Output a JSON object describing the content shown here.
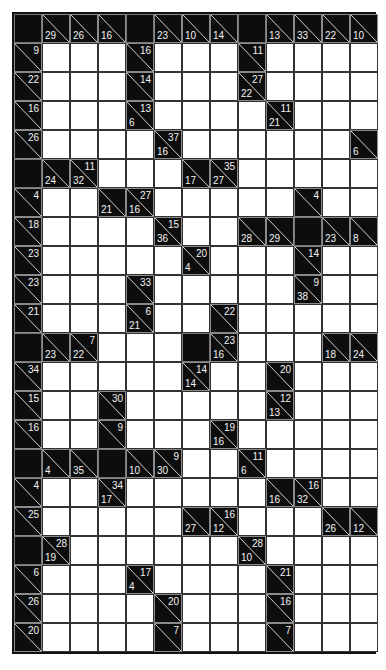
{
  "puzzle": {
    "type": "kakuro",
    "cols": 13,
    "rows": 22,
    "legend": {
      "B": "blank black cell",
      "W": "white entry cell",
      "C": "clue cell (a = across sum, d = down sum)"
    },
    "grid": [
      [
        {
          "t": "B"
        },
        {
          "t": "C",
          "d": "29"
        },
        {
          "t": "C",
          "d": "26"
        },
        {
          "t": "C",
          "d": "16"
        },
        {
          "t": "B"
        },
        {
          "t": "C",
          "d": "23"
        },
        {
          "t": "C",
          "d": "10"
        },
        {
          "t": "C",
          "d": "14"
        },
        {
          "t": "B"
        },
        {
          "t": "C",
          "d": "13"
        },
        {
          "t": "C",
          "d": "33"
        },
        {
          "t": "C",
          "d": "22"
        },
        {
          "t": "C",
          "d": "10"
        }
      ],
      [
        {
          "t": "C",
          "a": "9"
        },
        {
          "t": "W"
        },
        {
          "t": "W"
        },
        {
          "t": "W"
        },
        {
          "t": "C",
          "a": "16"
        },
        {
          "t": "W"
        },
        {
          "t": "W"
        },
        {
          "t": "W"
        },
        {
          "t": "C",
          "a": "11"
        },
        {
          "t": "W"
        },
        {
          "t": "W"
        },
        {
          "t": "W"
        },
        {
          "t": "W"
        }
      ],
      [
        {
          "t": "C",
          "a": "22"
        },
        {
          "t": "W"
        },
        {
          "t": "W"
        },
        {
          "t": "W"
        },
        {
          "t": "C",
          "a": "14"
        },
        {
          "t": "W"
        },
        {
          "t": "W"
        },
        {
          "t": "W"
        },
        {
          "t": "C",
          "a": "27",
          "d": "22"
        },
        {
          "t": "W"
        },
        {
          "t": "W"
        },
        {
          "t": "W"
        },
        {
          "t": "W"
        }
      ],
      [
        {
          "t": "C",
          "a": "16"
        },
        {
          "t": "W"
        },
        {
          "t": "W"
        },
        {
          "t": "W"
        },
        {
          "t": "C",
          "a": "13",
          "d": "6"
        },
        {
          "t": "W"
        },
        {
          "t": "W"
        },
        {
          "t": "W"
        },
        {
          "t": "W"
        },
        {
          "t": "C",
          "a": "11",
          "d": "21"
        },
        {
          "t": "W"
        },
        {
          "t": "W"
        },
        {
          "t": "W"
        }
      ],
      [
        {
          "t": "C",
          "a": "26"
        },
        {
          "t": "W"
        },
        {
          "t": "W"
        },
        {
          "t": "W"
        },
        {
          "t": "W"
        },
        {
          "t": "C",
          "a": "37",
          "d": "16"
        },
        {
          "t": "W"
        },
        {
          "t": "W"
        },
        {
          "t": "W"
        },
        {
          "t": "W"
        },
        {
          "t": "W"
        },
        {
          "t": "W"
        },
        {
          "t": "C",
          "d": "6"
        }
      ],
      [
        {
          "t": "B"
        },
        {
          "t": "C",
          "d": "24"
        },
        {
          "t": "C",
          "a": "11",
          "d": "32"
        },
        {
          "t": "W"
        },
        {
          "t": "W"
        },
        {
          "t": "W"
        },
        {
          "t": "C",
          "d": "17"
        },
        {
          "t": "C",
          "a": "35",
          "d": "27"
        },
        {
          "t": "W"
        },
        {
          "t": "W"
        },
        {
          "t": "W"
        },
        {
          "t": "W"
        },
        {
          "t": "W"
        }
      ],
      [
        {
          "t": "C",
          "a": "4"
        },
        {
          "t": "W"
        },
        {
          "t": "W"
        },
        {
          "t": "C",
          "d": "21"
        },
        {
          "t": "C",
          "a": "27",
          "d": "16"
        },
        {
          "t": "W"
        },
        {
          "t": "W"
        },
        {
          "t": "W"
        },
        {
          "t": "W"
        },
        {
          "t": "W"
        },
        {
          "t": "C",
          "a": "4"
        },
        {
          "t": "W"
        },
        {
          "t": "W"
        }
      ],
      [
        {
          "t": "C",
          "a": "18"
        },
        {
          "t": "W"
        },
        {
          "t": "W"
        },
        {
          "t": "W"
        },
        {
          "t": "W"
        },
        {
          "t": "C",
          "a": "15",
          "d": "36"
        },
        {
          "t": "W"
        },
        {
          "t": "W"
        },
        {
          "t": "C",
          "d": "28"
        },
        {
          "t": "C",
          "d": "29"
        },
        {
          "t": "B"
        },
        {
          "t": "C",
          "d": "23"
        },
        {
          "t": "C",
          "d": "8"
        }
      ],
      [
        {
          "t": "C",
          "a": "23"
        },
        {
          "t": "W"
        },
        {
          "t": "W"
        },
        {
          "t": "W"
        },
        {
          "t": "W"
        },
        {
          "t": "W"
        },
        {
          "t": "C",
          "a": "20",
          "d": "4"
        },
        {
          "t": "W"
        },
        {
          "t": "W"
        },
        {
          "t": "W"
        },
        {
          "t": "C",
          "a": "14"
        },
        {
          "t": "W"
        },
        {
          "t": "W"
        }
      ],
      [
        {
          "t": "C",
          "a": "23"
        },
        {
          "t": "W"
        },
        {
          "t": "W"
        },
        {
          "t": "W"
        },
        {
          "t": "C",
          "a": "33"
        },
        {
          "t": "W"
        },
        {
          "t": "W"
        },
        {
          "t": "W"
        },
        {
          "t": "W"
        },
        {
          "t": "W"
        },
        {
          "t": "C",
          "a": "9",
          "d": "38"
        },
        {
          "t": "W"
        },
        {
          "t": "W"
        }
      ],
      [
        {
          "t": "C",
          "a": "21"
        },
        {
          "t": "W"
        },
        {
          "t": "W"
        },
        {
          "t": "W"
        },
        {
          "t": "C",
          "a": "6",
          "d": "21"
        },
        {
          "t": "W"
        },
        {
          "t": "W"
        },
        {
          "t": "C",
          "a": "22"
        },
        {
          "t": "W"
        },
        {
          "t": "W"
        },
        {
          "t": "W"
        },
        {
          "t": "W"
        },
        {
          "t": "W"
        }
      ],
      [
        {
          "t": "B"
        },
        {
          "t": "C",
          "d": "23"
        },
        {
          "t": "C",
          "a": "7",
          "d": "22"
        },
        {
          "t": "W"
        },
        {
          "t": "W"
        },
        {
          "t": "W"
        },
        {
          "t": "B"
        },
        {
          "t": "C",
          "a": "23",
          "d": "16"
        },
        {
          "t": "W"
        },
        {
          "t": "W"
        },
        {
          "t": "W"
        },
        {
          "t": "C",
          "d": "18"
        },
        {
          "t": "C",
          "d": "24"
        }
      ],
      [
        {
          "t": "C",
          "a": "34"
        },
        {
          "t": "W"
        },
        {
          "t": "W"
        },
        {
          "t": "W"
        },
        {
          "t": "W"
        },
        {
          "t": "W"
        },
        {
          "t": "C",
          "a": "14",
          "d": "14"
        },
        {
          "t": "W"
        },
        {
          "t": "W"
        },
        {
          "t": "C",
          "a": "20"
        },
        {
          "t": "W"
        },
        {
          "t": "W"
        },
        {
          "t": "W"
        }
      ],
      [
        {
          "t": "C",
          "a": "15"
        },
        {
          "t": "W"
        },
        {
          "t": "W"
        },
        {
          "t": "C",
          "a": "30"
        },
        {
          "t": "W"
        },
        {
          "t": "W"
        },
        {
          "t": "W"
        },
        {
          "t": "W"
        },
        {
          "t": "W"
        },
        {
          "t": "C",
          "a": "12",
          "d": "13"
        },
        {
          "t": "W"
        },
        {
          "t": "W"
        },
        {
          "t": "W"
        }
      ],
      [
        {
          "t": "C",
          "a": "16"
        },
        {
          "t": "W"
        },
        {
          "t": "W"
        },
        {
          "t": "C",
          "a": "9"
        },
        {
          "t": "W"
        },
        {
          "t": "W"
        },
        {
          "t": "W"
        },
        {
          "t": "C",
          "a": "19",
          "d": "16"
        },
        {
          "t": "W"
        },
        {
          "t": "W"
        },
        {
          "t": "W"
        },
        {
          "t": "W"
        },
        {
          "t": "W"
        }
      ],
      [
        {
          "t": "B"
        },
        {
          "t": "C",
          "d": "4"
        },
        {
          "t": "C",
          "d": "35"
        },
        {
          "t": "B"
        },
        {
          "t": "C",
          "d": "10"
        },
        {
          "t": "C",
          "a": "9",
          "d": "30"
        },
        {
          "t": "W"
        },
        {
          "t": "W"
        },
        {
          "t": "C",
          "a": "11",
          "d": "6"
        },
        {
          "t": "W"
        },
        {
          "t": "W"
        },
        {
          "t": "W"
        },
        {
          "t": "W"
        }
      ],
      [
        {
          "t": "C",
          "a": "4"
        },
        {
          "t": "W"
        },
        {
          "t": "W"
        },
        {
          "t": "C",
          "a": "34",
          "d": "17"
        },
        {
          "t": "W"
        },
        {
          "t": "W"
        },
        {
          "t": "W"
        },
        {
          "t": "W"
        },
        {
          "t": "W"
        },
        {
          "t": "C",
          "d": "16"
        },
        {
          "t": "C",
          "a": "16",
          "d": "32"
        },
        {
          "t": "W"
        },
        {
          "t": "W"
        }
      ],
      [
        {
          "t": "C",
          "a": "25"
        },
        {
          "t": "W"
        },
        {
          "t": "W"
        },
        {
          "t": "W"
        },
        {
          "t": "W"
        },
        {
          "t": "W"
        },
        {
          "t": "C",
          "d": "27"
        },
        {
          "t": "C",
          "a": "16",
          "d": "12"
        },
        {
          "t": "W"
        },
        {
          "t": "W"
        },
        {
          "t": "W"
        },
        {
          "t": "C",
          "d": "26"
        },
        {
          "t": "C",
          "d": "12"
        }
      ],
      [
        {
          "t": "B"
        },
        {
          "t": "C",
          "a": "28",
          "d": "19"
        },
        {
          "t": "W"
        },
        {
          "t": "W"
        },
        {
          "t": "W"
        },
        {
          "t": "W"
        },
        {
          "t": "W"
        },
        {
          "t": "W"
        },
        {
          "t": "C",
          "a": "28",
          "d": "10"
        },
        {
          "t": "W"
        },
        {
          "t": "W"
        },
        {
          "t": "W"
        },
        {
          "t": "W"
        }
      ],
      [
        {
          "t": "C",
          "a": "6"
        },
        {
          "t": "W"
        },
        {
          "t": "W"
        },
        {
          "t": "W"
        },
        {
          "t": "C",
          "a": "17",
          "d": "4"
        },
        {
          "t": "W"
        },
        {
          "t": "W"
        },
        {
          "t": "W"
        },
        {
          "t": "W"
        },
        {
          "t": "C",
          "a": "21"
        },
        {
          "t": "W"
        },
        {
          "t": "W"
        },
        {
          "t": "W"
        }
      ],
      [
        {
          "t": "C",
          "a": "26"
        },
        {
          "t": "W"
        },
        {
          "t": "W"
        },
        {
          "t": "W"
        },
        {
          "t": "W"
        },
        {
          "t": "C",
          "a": "20"
        },
        {
          "t": "W"
        },
        {
          "t": "W"
        },
        {
          "t": "W"
        },
        {
          "t": "C",
          "a": "16"
        },
        {
          "t": "W"
        },
        {
          "t": "W"
        },
        {
          "t": "W"
        }
      ],
      [
        {
          "t": "C",
          "a": "20"
        },
        {
          "t": "W"
        },
        {
          "t": "W"
        },
        {
          "t": "W"
        },
        {
          "t": "W"
        },
        {
          "t": "C",
          "a": "7"
        },
        {
          "t": "W"
        },
        {
          "t": "W"
        },
        {
          "t": "W"
        },
        {
          "t": "C",
          "a": "7"
        },
        {
          "t": "W"
        },
        {
          "t": "W"
        },
        {
          "t": "W"
        }
      ]
    ]
  },
  "colors": {
    "block": "#0d0d0d",
    "white": "#ffffff",
    "clue_text": "#f2f2f2",
    "grid_line": "#333333"
  }
}
